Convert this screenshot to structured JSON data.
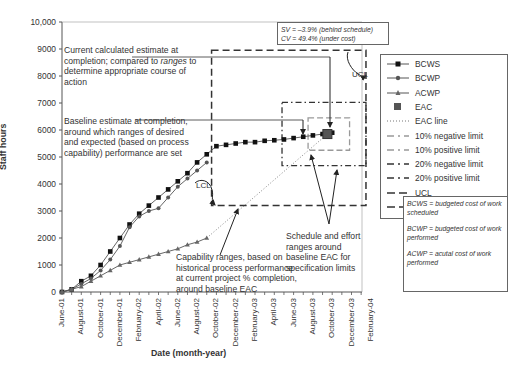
{
  "chart_data": {
    "type": "line",
    "title": "",
    "xlabel": "Date (month-year)",
    "ylabel": "Staff hours",
    "ylim": [
      0,
      10000
    ],
    "yticks": [
      "0",
      "1000",
      "2000",
      "3000",
      "4000",
      "5000",
      "6000",
      "7000",
      "8000",
      "9000",
      "10,000"
    ],
    "xtick_labels": [
      "June-01",
      "August-01",
      "October-01",
      "December-01",
      "February-02",
      "April-02",
      "June-02",
      "August-02",
      "October-02",
      "December-02",
      "February-03",
      "April-03",
      "June-03",
      "August-03",
      "October-03",
      "December-03",
      "February-04"
    ],
    "grid": false,
    "legend_position": "right",
    "series": [
      {
        "name": "BCWS",
        "marker": "square",
        "months": [
          0,
          1,
          2,
          3,
          4,
          5,
          6,
          7,
          8,
          9,
          10,
          11,
          12,
          13,
          14,
          15,
          16,
          17,
          18,
          19,
          20,
          21,
          22,
          23,
          24,
          25,
          26,
          27,
          28
        ],
        "values": [
          0,
          100,
          400,
          600,
          1000,
          1500,
          2000,
          2500,
          2900,
          3200,
          3500,
          3800,
          4100,
          4400,
          4800,
          5100,
          5400,
          5450,
          5500,
          5550,
          5550,
          5600,
          5620,
          5650,
          5700,
          5750,
          5800,
          5850,
          5900
        ]
      },
      {
        "name": "BCWP",
        "marker": "diamond",
        "months": [
          0,
          1,
          2,
          3,
          4,
          5,
          6,
          7,
          8,
          9,
          10,
          11,
          12,
          13,
          14,
          15
        ],
        "values": [
          0,
          100,
          300,
          500,
          800,
          1200,
          1700,
          2400,
          2800,
          3000,
          3100,
          3500,
          3900,
          4200,
          4500,
          4800
        ]
      },
      {
        "name": "ACWP",
        "marker": "triangle",
        "months": [
          0,
          1,
          2,
          3,
          4,
          5,
          6,
          7,
          8,
          9,
          10,
          11,
          12,
          13,
          14,
          15
        ],
        "values": [
          0,
          100,
          200,
          400,
          600,
          800,
          1000,
          1100,
          1200,
          1300,
          1400,
          1500,
          1600,
          1750,
          1850,
          2000
        ]
      },
      {
        "name": "EAC",
        "marker": "big-square",
        "months": [
          27.5
        ],
        "values": [
          5850
        ]
      }
    ],
    "reference_lines": [
      {
        "name": "EAC line",
        "style": "dotted",
        "from": [
          15,
          2000
        ],
        "to": [
          27.5,
          5850
        ]
      },
      {
        "name": "10% negative limit",
        "value": 5250
      },
      {
        "name": "10% positive limit",
        "value": 6450
      },
      {
        "name": "20% negative limit",
        "value": 4680
      },
      {
        "name": "20% positive limit",
        "value": 7020
      },
      {
        "name": "UCL",
        "value": 8950
      },
      {
        "name": "LCL",
        "value": 3200
      }
    ]
  },
  "legend": {
    "items": [
      {
        "label": "BCWS",
        "style": "line-square"
      },
      {
        "label": "BCWP",
        "style": "line-diamond"
      },
      {
        "label": "ACWP",
        "style": "line-triangle"
      },
      {
        "label": "EAC",
        "style": "big-square"
      },
      {
        "label": "EAC line",
        "style": "dotted"
      },
      {
        "label": "10% negative limit",
        "style": "dash-light"
      },
      {
        "label": "10% positive limit",
        "style": "dash-light"
      },
      {
        "label": "20% negative limit",
        "style": "dash-dot-dark"
      },
      {
        "label": "20% positive limit",
        "style": "dash-dot-dark"
      },
      {
        "label": "UCL",
        "style": "long-dash"
      },
      {
        "label": "LCL",
        "style": "long-dash"
      }
    ]
  },
  "definitions": [
    "BCWS = budgeted cost of work scheduled",
    "BCWP = budgeted cost of work performed",
    "ACWP = acutal cost of work performed"
  ],
  "variance_box": {
    "sv": "SV = –3.9% (behind schedule)",
    "cv": "CV = 49.4% (under cost)"
  },
  "annotations": {
    "current_eac": "Current calculated estimate at completion; compared to ranges to determine appropriate course of action",
    "current_eac_parts": [
      "Current calculated estimate at completion; compared to ",
      "ranges",
      " to determine appropriate course of action"
    ],
    "baseline_eac": "Baseline estimate at completion, around which ranges of desired and expected (based on process capability) performance are set",
    "capability_ranges": "Capability ranges, based on historical process performance at current project % completion, around baseline EAC",
    "schedule_effort": "Schedule and effort ranges around baseline EAC for specification limits",
    "ucl_label": "UCL",
    "lcl_label": "LCL"
  }
}
